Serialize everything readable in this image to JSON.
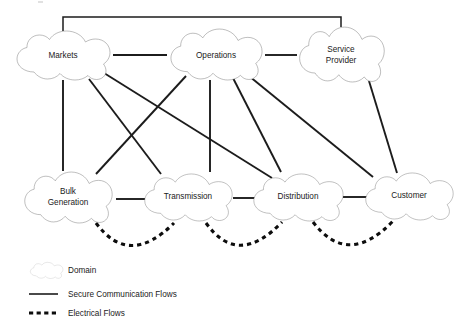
{
  "diagram": {
    "domains": [
      {
        "id": "markets",
        "label": "Markets",
        "label_lines": [
          "Markets"
        ],
        "cx": 63,
        "cy": 55,
        "rx": 50,
        "ry": 25
      },
      {
        "id": "operations",
        "label": "Operations",
        "label_lines": [
          "Operations"
        ],
        "cx": 216,
        "cy": 54,
        "rx": 49,
        "ry": 26
      },
      {
        "id": "service-provider",
        "label": "Service Provider",
        "label_lines": [
          "Service",
          "Provider"
        ],
        "cx": 341,
        "cy": 54,
        "rx": 45,
        "ry": 28
      },
      {
        "id": "bulk-generation",
        "label": "Bulk Generation",
        "label_lines": [
          "Bulk",
          "Generation"
        ],
        "cx": 68,
        "cy": 196,
        "rx": 47,
        "ry": 26
      },
      {
        "id": "transmission",
        "label": "Transmission",
        "label_lines": [
          "Transmission"
        ],
        "cx": 188,
        "cy": 196,
        "rx": 47,
        "ry": 24
      },
      {
        "id": "distribution",
        "label": "Distribution",
        "label_lines": [
          "Distribution"
        ],
        "cx": 298,
        "cy": 196,
        "rx": 48,
        "ry": 24
      },
      {
        "id": "customer",
        "label": "Customer",
        "label_lines": [
          "Customer"
        ],
        "cx": 409,
        "cy": 195,
        "rx": 47,
        "ry": 24
      }
    ],
    "secure_communication_flows": [
      {
        "from": "markets",
        "to": "operations",
        "path": "M 113 55 L 167 55"
      },
      {
        "from": "operations",
        "to": "service-provider",
        "path": "M 265 55 L 297 55"
      },
      {
        "from": "markets",
        "to": "service-provider",
        "path": "M 63 31 L 63 17 L 341 17 L 341 27"
      },
      {
        "from": "markets",
        "to": "bulk-generation",
        "path": "M 63 80 L 63 171"
      },
      {
        "from": "markets",
        "to": "transmission",
        "path": "M 89 79 L 161 174"
      },
      {
        "from": "markets",
        "to": "distribution",
        "path": "M 104 73 L 272 178"
      },
      {
        "from": "operations",
        "to": "bulk-generation",
        "path": "M 186 76 L 96 174"
      },
      {
        "from": "operations",
        "to": "transmission",
        "path": "M 210 80 L 210 172"
      },
      {
        "from": "operations",
        "to": "distribution",
        "path": "M 233 78 L 281 172"
      },
      {
        "from": "operations",
        "to": "customer",
        "path": "M 249 76 L 373 177"
      },
      {
        "from": "service-provider",
        "to": "customer",
        "path": "M 369 81 L 397 173"
      },
      {
        "from": "bulk-generation",
        "to": "transmission",
        "path": "M 116 199 L 147 199"
      },
      {
        "from": "transmission",
        "to": "distribution",
        "path": "M 233 198 L 258 198"
      },
      {
        "from": "distribution",
        "to": "customer",
        "path": "M 343 197 L 368 197"
      }
    ],
    "electrical_flows": [
      {
        "from": "bulk-generation",
        "to": "transmission",
        "path": "M 96 223 Q 129 268 174 223"
      },
      {
        "from": "transmission",
        "to": "distribution",
        "path": "M 206 223 Q 238 268 282 222"
      },
      {
        "from": "distribution",
        "to": "customer",
        "path": "M 313 222 Q 348 268 393 221"
      }
    ]
  },
  "legend": {
    "items": [
      {
        "id": "domain",
        "symbol": "cloud-glyph",
        "label": "Domain"
      },
      {
        "id": "secure-comm-flows",
        "symbol": "solid-line",
        "label": "Secure Communication Flows"
      },
      {
        "id": "electrical-flows",
        "symbol": "dashed-line",
        "label": "Electrical Flows"
      }
    ]
  }
}
